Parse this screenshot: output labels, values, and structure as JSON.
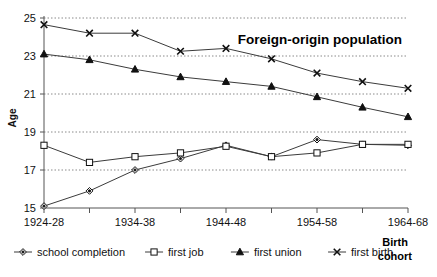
{
  "chart_data": {
    "type": "line",
    "title": "Foreign-origin population",
    "xlabel": "Birth cohort",
    "xlabel_line1": "Birth",
    "xlabel_line2": "cohort",
    "ylabel": "Age",
    "ylim": [
      15,
      25
    ],
    "yticks": [
      15,
      17,
      19,
      21,
      23,
      25
    ],
    "grid": true,
    "legend_position": "bottom",
    "categories": [
      "1924-28",
      "1929-33",
      "1934-38",
      "1939-43",
      "1944-48",
      "1949-53",
      "1954-58",
      "1959-63",
      "1964-68"
    ],
    "tick_labels": [
      "1924-28",
      "",
      "1934-38",
      "",
      "1944-48",
      "",
      "1954-58",
      "",
      "1964-68"
    ],
    "series": [
      {
        "name": "school completion",
        "marker": "diamond",
        "values": [
          15.1,
          15.9,
          17.0,
          17.6,
          18.3,
          17.7,
          18.6,
          18.35,
          18.3
        ]
      },
      {
        "name": "first job",
        "marker": "square-open",
        "values": [
          18.3,
          17.4,
          17.7,
          17.9,
          18.25,
          17.7,
          17.9,
          18.35,
          18.35
        ]
      },
      {
        "name": "first union",
        "marker": "triangle",
        "values": [
          23.1,
          22.8,
          22.3,
          21.9,
          21.65,
          21.4,
          20.85,
          20.3,
          19.8
        ]
      },
      {
        "name": "first birth",
        "marker": "cross",
        "values": [
          24.65,
          24.2,
          24.2,
          23.25,
          23.4,
          22.85,
          22.1,
          21.65,
          21.3
        ]
      }
    ]
  },
  "legend": {
    "items": [
      {
        "label": "school completion",
        "marker": "diamond"
      },
      {
        "label": "first job",
        "marker": "square-open"
      },
      {
        "label": "first union",
        "marker": "triangle"
      },
      {
        "label": "first birth",
        "marker": "cross"
      }
    ]
  },
  "colors": {
    "line": "#3b3b3b",
    "grid": "#8a8a8a",
    "axis": "#555555",
    "text": "#111111"
  }
}
